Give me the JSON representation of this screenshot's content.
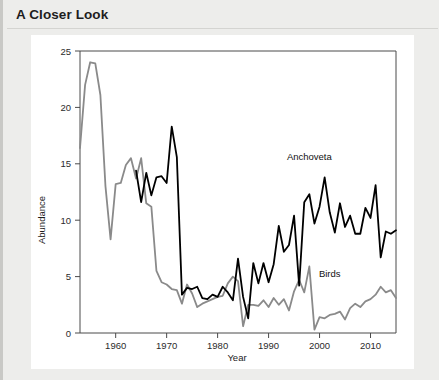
{
  "card": {
    "title": "A Closer Look",
    "background_color": "#ededeb",
    "panel_color": "#ffffff"
  },
  "chart_data": {
    "type": "line",
    "title": "",
    "subtitle": "",
    "xlabel": "Year",
    "ylabel": "Abundance",
    "xlim": [
      1953,
      2015
    ],
    "ylim": [
      0,
      25
    ],
    "xticks": [
      1960,
      1970,
      1980,
      1990,
      2000,
      2010
    ],
    "yticks": [
      0,
      5,
      10,
      15,
      20,
      25
    ],
    "xtick_labels": [
      "1960",
      "1970",
      "1980",
      "1990",
      "2000",
      "2010"
    ],
    "ytick_labels": [
      "0",
      "5",
      "10",
      "15",
      "20",
      "25"
    ],
    "grid": false,
    "legend_position": "inline-annotation",
    "annotations": [
      {
        "text": "Anchoveta",
        "x": 1998,
        "y": 15.3,
        "series": "Anchoveta"
      },
      {
        "text": "Birds",
        "x": 2002,
        "y": 5.0,
        "series": "Birds"
      }
    ],
    "series": [
      {
        "name": "Anchoveta",
        "color": "#000000",
        "stroke_width": 1.8,
        "x": [
          1964,
          1965,
          1966,
          1967,
          1968,
          1969,
          1970,
          1971,
          1972,
          1973,
          1974,
          1975,
          1976,
          1977,
          1978,
          1979,
          1980,
          1981,
          1982,
          1983,
          1984,
          1985,
          1986,
          1987,
          1988,
          1989,
          1990,
          1991,
          1992,
          1993,
          1994,
          1995,
          1996,
          1997,
          1998,
          1999,
          2000,
          2001,
          2002,
          2003,
          2004,
          2005,
          2006,
          2007,
          2008,
          2009,
          2010,
          2011,
          2012,
          2013,
          2014,
          2015
        ],
        "values": [
          14.4,
          11.6,
          14.2,
          12.2,
          13.8,
          13.9,
          13.3,
          18.3,
          15.6,
          3.4,
          4.0,
          3.9,
          4.1,
          3.1,
          3.0,
          3.4,
          3.2,
          4.1,
          3.6,
          2.9,
          6.6,
          3.2,
          1.3,
          6.2,
          4.4,
          6.2,
          4.5,
          6.1,
          9.5,
          7.2,
          7.8,
          10.4,
          4.2,
          11.6,
          12.3,
          9.7,
          11.2,
          13.8,
          10.7,
          8.9,
          11.5,
          9.4,
          10.4,
          8.8,
          8.8,
          11.1,
          10.2,
          13.1,
          6.7,
          9.0,
          8.8,
          9.1
        ]
      },
      {
        "name": "Birds",
        "color": "#8a8a8a",
        "stroke_width": 1.8,
        "x": [
          1953,
          1954,
          1955,
          1956,
          1957,
          1958,
          1959,
          1960,
          1961,
          1962,
          1963,
          1964,
          1965,
          1966,
          1967,
          1968,
          1969,
          1970,
          1971,
          1972,
          1973,
          1974,
          1975,
          1976,
          1977,
          1978,
          1979,
          1980,
          1981,
          1982,
          1983,
          1984,
          1985,
          1986,
          1987,
          1988,
          1989,
          1990,
          1991,
          1992,
          1993,
          1994,
          1995,
          1996,
          1997,
          1998,
          1999,
          2000,
          2001,
          2002,
          2003,
          2004,
          2005,
          2006,
          2007,
          2008,
          2009,
          2010,
          2011,
          2012,
          2013,
          2014,
          2015
        ],
        "values": [
          16.4,
          22.0,
          24.0,
          23.9,
          21.1,
          13.0,
          8.3,
          13.2,
          13.3,
          14.9,
          15.5,
          13.7,
          15.5,
          11.5,
          11.2,
          5.5,
          4.5,
          4.3,
          3.9,
          3.8,
          2.6,
          4.3,
          3.5,
          2.3,
          2.6,
          2.8,
          3.0,
          3.2,
          3.3,
          4.4,
          5.0,
          4.6,
          0.6,
          2.5,
          2.5,
          2.4,
          2.9,
          2.3,
          3.1,
          2.5,
          3.0,
          2.0,
          3.7,
          4.7,
          3.6,
          5.9,
          0.3,
          1.4,
          1.3,
          1.6,
          1.7,
          1.9,
          1.2,
          2.2,
          2.6,
          2.3,
          2.8,
          3.0,
          3.4,
          4.1,
          3.6,
          3.8,
          3.1
        ]
      }
    ]
  }
}
